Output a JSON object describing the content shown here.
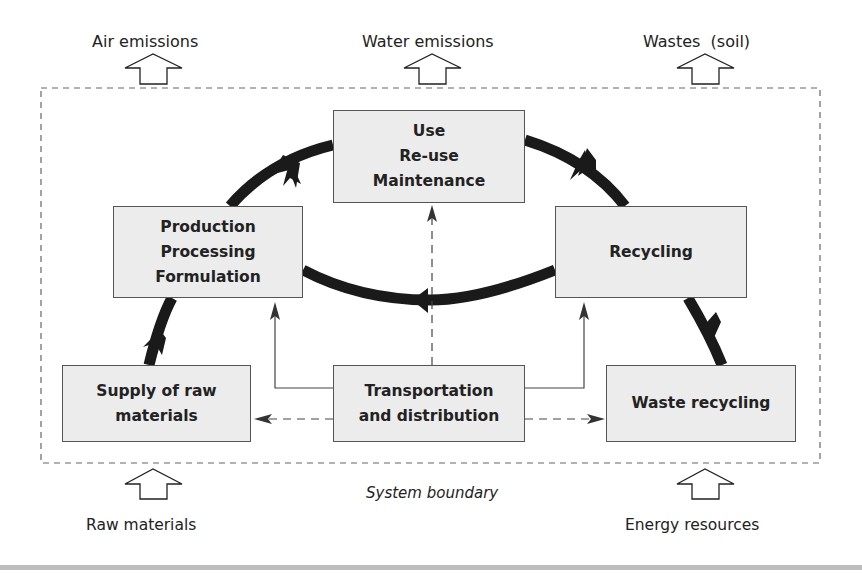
{
  "outputs": {
    "air": "Air emissions",
    "water": "Water emissions",
    "wastes": "Wastes  (soil)"
  },
  "inputs": {
    "raw": "Raw materials",
    "energy": "Energy resources"
  },
  "boundary_label": "System boundary",
  "stages": {
    "use": [
      "Use",
      "Re-use",
      "Maintenance"
    ],
    "production": [
      "Production",
      "Processing",
      "Formulation"
    ],
    "recycling": [
      "Recycling"
    ],
    "supply": [
      "Supply of raw",
      "materials"
    ],
    "transport": [
      "Transportation",
      "and distribution"
    ],
    "waste": [
      "Waste recycling"
    ]
  },
  "colors": {
    "box_fill": "#ececec",
    "box_border": "#555555",
    "cycle_arrow": "#1a1a1a",
    "boundary": "#666666",
    "rule": "#bdbdbd"
  }
}
